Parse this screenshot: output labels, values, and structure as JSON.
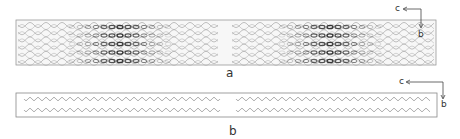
{
  "panels": [
    {
      "id": "a",
      "label": "a",
      "description": "Crystal packing view showing wavy molecular chains with electron density (two halves)",
      "axes": {
        "horizontal": "c",
        "vertical": "b"
      }
    },
    {
      "id": "b",
      "label": "b",
      "description": "Simplified schematic of zigzag chains in two halves, two rows each",
      "axes": {
        "horizontal": "c",
        "vertical": "b"
      }
    }
  ],
  "colors": {
    "line": "#777777",
    "dense": "#333333",
    "frame": "#888888"
  }
}
